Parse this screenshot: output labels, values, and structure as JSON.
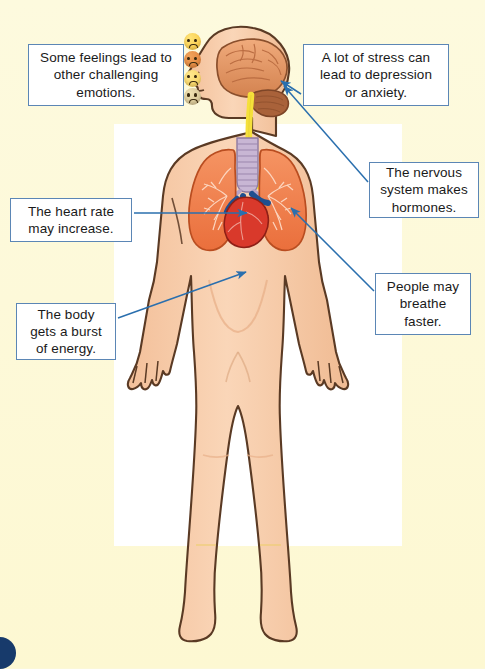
{
  "page": {
    "background_color": "#fdf9d9",
    "panel_color": "#ffffff",
    "accent_color": "#5b86b5",
    "arrow_color": "#2a6fae",
    "corner_dot_color": "#173a6b"
  },
  "callouts": [
    {
      "id": "feelings",
      "text": "Some feelings lead to other challenging emotions."
    },
    {
      "id": "stress",
      "text": "A lot of stress can lead to depression or anxiety."
    },
    {
      "id": "nervous",
      "text": "The nervous system makes hormones."
    },
    {
      "id": "heart",
      "text": "The heart rate may increase."
    },
    {
      "id": "body",
      "text": "The body gets a burst of energy."
    },
    {
      "id": "breathe",
      "text": "People may breathe faster."
    }
  ],
  "emojis": [
    {
      "name": "worried-face-emoji",
      "color": "#f6c33c"
    },
    {
      "name": "angry-face-emoji",
      "color": "#db7a35"
    },
    {
      "name": "sad-face-emoji",
      "color": "#f3cb55"
    },
    {
      "name": "anxious-face-emoji",
      "color": "#cbb98a"
    }
  ],
  "anatomy": {
    "skin_color": "#f6c9a5",
    "outline_color": "#5a3a24",
    "brain_color": "#e79b6a",
    "cerebellum_color": "#a9623a",
    "spinal_cord_color": "#f5e03a",
    "trachea_color": "#c8b6d4",
    "lung_color": "#f07f4a",
    "heart_color": "#d9392b",
    "vessel_color": "#1f4f8f",
    "parts": [
      "brain",
      "cerebellum",
      "spinal-cord",
      "trachea",
      "left-lung",
      "right-lung",
      "heart",
      "body-outline"
    ]
  },
  "arrows": [
    {
      "from": "stress-callout",
      "to": "brain-stem"
    },
    {
      "from": "nervous-callout",
      "to": "brain-stem"
    },
    {
      "from": "heart-callout",
      "to": "heart"
    },
    {
      "from": "breathe-callout",
      "to": "right-lung"
    },
    {
      "from": "body-callout",
      "to": "abdomen"
    }
  ]
}
